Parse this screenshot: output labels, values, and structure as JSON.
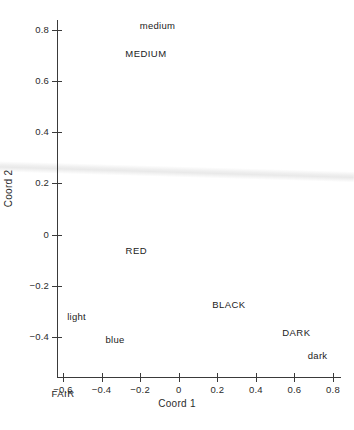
{
  "chart_data": {
    "type": "scatter",
    "title": "",
    "subtitle": "",
    "xlabel": "Coord 1",
    "ylabel": "Coord 2",
    "xlim": [
      -0.7,
      0.83
    ],
    "ylim": [
      -0.52,
      0.88
    ],
    "xticks": [
      "-0.6",
      "-0.4",
      "-0.2",
      "0",
      "0.2",
      "0.4",
      "0.6",
      "0.8"
    ],
    "xtick_values": [
      -0.6,
      -0.4,
      -0.2,
      0,
      0.2,
      0.4,
      0.6,
      0.8
    ],
    "yticks": [
      "0.8",
      "0.6",
      "0.4",
      "0.2",
      "0",
      "-0.2",
      "-0.4"
    ],
    "ytick_values": [
      0.8,
      0.6,
      0.4,
      0.2,
      0,
      -0.2,
      -0.4
    ],
    "grid": false,
    "legend": null,
    "marker_style": "text-label-only",
    "points": [
      {
        "label": "medium",
        "x": -0.11,
        "y": 0.82,
        "group": "lowercase"
      },
      {
        "label": "MEDIUM",
        "x": -0.17,
        "y": 0.71,
        "group": "uppercase"
      },
      {
        "label": "RED",
        "x": -0.22,
        "y": -0.06,
        "group": "uppercase"
      },
      {
        "label": "BLACK",
        "x": 0.26,
        "y": -0.27,
        "group": "uppercase"
      },
      {
        "label": "light",
        "x": -0.53,
        "y": -0.32,
        "group": "lowercase"
      },
      {
        "label": "DARK",
        "x": 0.61,
        "y": -0.38,
        "group": "uppercase"
      },
      {
        "label": "blue",
        "x": -0.33,
        "y": -0.41,
        "group": "lowercase"
      },
      {
        "label": "dark",
        "x": 0.72,
        "y": -0.47,
        "group": "lowercase"
      },
      {
        "label": "FAIR",
        "x": -0.6,
        "y": -0.62,
        "group": "uppercase"
      }
    ],
    "artifact": {
      "name": "scan-crease-line",
      "color": "#ececec"
    }
  }
}
